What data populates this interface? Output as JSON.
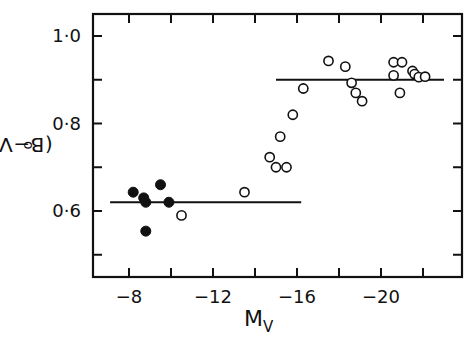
{
  "chart_data": {
    "type": "scatter",
    "title": "",
    "xlabel": "M_V",
    "xlabel_main": "M",
    "xlabel_sub": "V",
    "ylabel": "(B-V)o",
    "ylabel_main": "(B−V)",
    "ylabel_sub": "o",
    "xlim": [
      -6.2,
      -22.8
    ],
    "ylim": [
      0.47,
      1.06
    ],
    "x_ticks": [
      -8,
      -10,
      -12,
      -14,
      -16,
      -18,
      -20,
      -22
    ],
    "x_tick_labels": [
      "-8",
      "",
      "-12",
      "",
      "-16",
      "",
      "-20",
      ""
    ],
    "y_ticks": [
      0.5,
      0.6,
      0.7,
      0.8,
      0.9,
      1.0
    ],
    "y_tick_labels": [
      "",
      "0·6",
      "",
      "0·8",
      "",
      "1·0"
    ],
    "grid": false,
    "legend": null,
    "series": [
      {
        "name": "filled",
        "marker": "filled-circle",
        "points": [
          [
            -8.2,
            0.643
          ],
          [
            -8.7,
            0.63
          ],
          [
            -8.8,
            0.62
          ],
          [
            -9.5,
            0.66
          ],
          [
            -9.9,
            0.62
          ],
          [
            -8.8,
            0.554
          ]
        ]
      },
      {
        "name": "open",
        "marker": "open-circle",
        "points": [
          [
            -10.5,
            0.59
          ],
          [
            -13.5,
            0.643
          ],
          [
            -14.7,
            0.723
          ],
          [
            -15.0,
            0.7
          ],
          [
            -15.5,
            0.7
          ],
          [
            -15.2,
            0.77
          ],
          [
            -15.8,
            0.82
          ],
          [
            -16.3,
            0.88
          ],
          [
            -17.5,
            0.943
          ],
          [
            -18.3,
            0.93
          ],
          [
            -18.8,
            0.87
          ],
          [
            -18.6,
            0.893
          ],
          [
            -19.1,
            0.851
          ],
          [
            -20.6,
            0.94
          ],
          [
            -21.0,
            0.94
          ],
          [
            -20.6,
            0.91
          ],
          [
            -20.9,
            0.87
          ],
          [
            -21.5,
            0.92
          ],
          [
            -21.6,
            0.913
          ],
          [
            -21.8,
            0.906
          ],
          [
            -22.1,
            0.907
          ]
        ]
      }
    ],
    "reference_lines": [
      {
        "y": 0.62,
        "x_from": -7.1,
        "x_to": -16.2
      },
      {
        "y": 0.9,
        "x_from": -15.0,
        "x_to": -23.0
      }
    ]
  }
}
